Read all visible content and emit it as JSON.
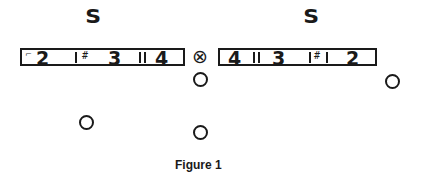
{
  "figure": {
    "caption": "Figure 1",
    "left_side_label": "S",
    "right_side_label": "S",
    "left_marker": {
      "numbers": [
        "2",
        "3",
        "4"
      ],
      "hash_glyph": "#"
    },
    "right_marker": {
      "numbers": [
        "4",
        "3",
        "2"
      ],
      "hash_glyph": "#"
    },
    "ball_symbol": "⊗",
    "players": [
      {
        "id": "player-under-ball",
        "x": 201,
        "y": 80
      },
      {
        "id": "player-right",
        "x": 393,
        "y": 82
      },
      {
        "id": "player-left-deep",
        "x": 87,
        "y": 123
      },
      {
        "id": "player-center-deep",
        "x": 201,
        "y": 133
      }
    ],
    "colors": {
      "ink": "#1a1a1a",
      "background": "#ffffff"
    }
  }
}
